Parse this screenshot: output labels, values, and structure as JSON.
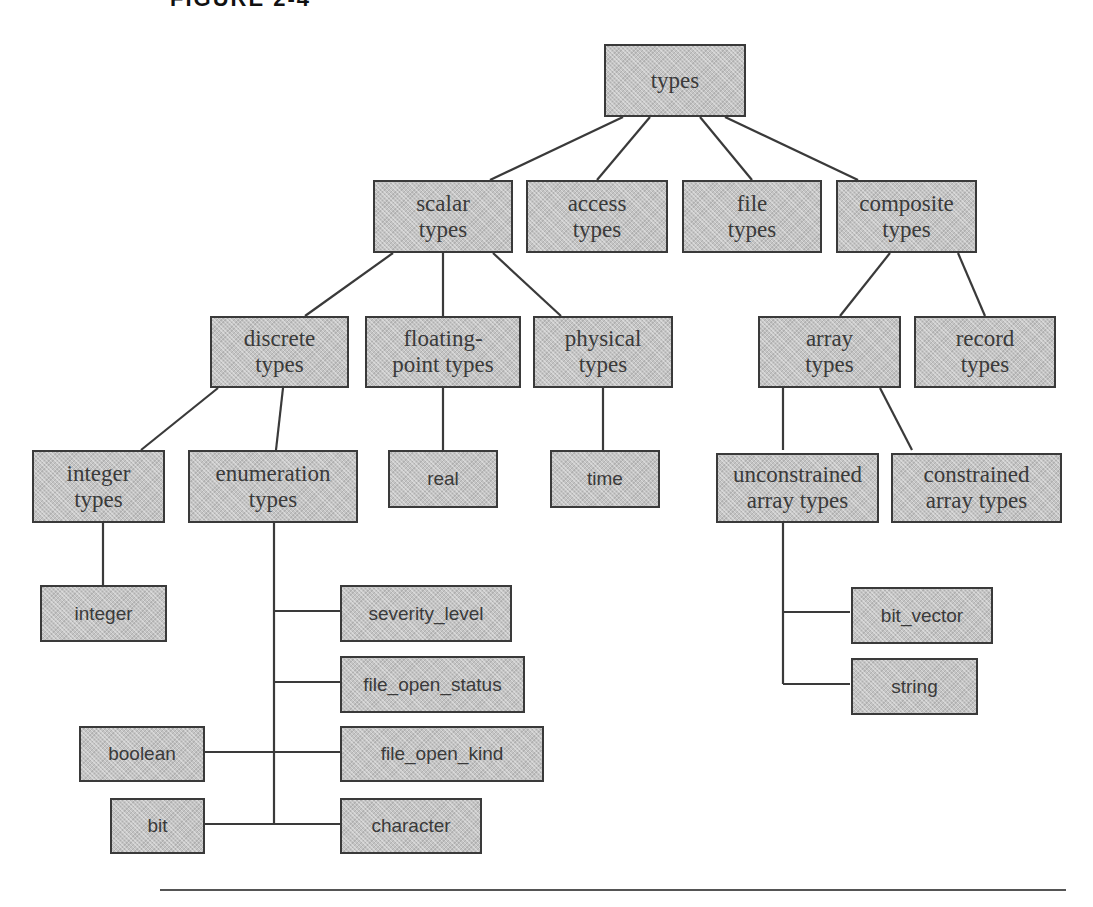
{
  "figure": {
    "caption": "FIGURE 2-4"
  },
  "nodes": {
    "types": "types",
    "scalar_types": "scalar types",
    "access_types": "access types",
    "file_types": "file types",
    "composite_types": "composite types",
    "discrete_types": "discrete types",
    "floating_point_types": "floating-point types",
    "physical_types": "physical types",
    "array_types": "array types",
    "record_types": "record types",
    "integer_types": "integer types",
    "enumeration_types": "enumeration types",
    "real": "real",
    "time": "time",
    "unconstrained_array_types": "unconstrained array types",
    "constrained_array_types": "constrained array types",
    "integer": "integer",
    "severity_level": "severity_level",
    "file_open_status": "file_open_status",
    "file_open_kind": "file_open_kind",
    "character": "character",
    "boolean": "boolean",
    "bit": "bit",
    "bit_vector": "bit_vector",
    "string": "string"
  },
  "lines_l1": {
    "scalar_line1": "scalar",
    "scalar_line2": "types",
    "access_line1": "access",
    "access_line2": "types",
    "file_line1": "file",
    "file_line2": "types",
    "composite_line1": "composite",
    "composite_line2": "types",
    "discrete_line1": "discrete",
    "discrete_line2": "types",
    "floating_line1": "floating-",
    "floating_line2": "point types",
    "physical_line1": "physical",
    "physical_line2": "types",
    "array_line1": "array",
    "array_line2": "types",
    "record_line1": "record",
    "record_line2": "types",
    "integer_types_line1": "integer",
    "integer_types_line2": "types",
    "enumeration_line1": "enumeration",
    "enumeration_line2": "types",
    "unconstrained_line1": "unconstrained",
    "unconstrained_line2": "array types",
    "constrained_line1": "constrained",
    "constrained_line2": "array types"
  }
}
